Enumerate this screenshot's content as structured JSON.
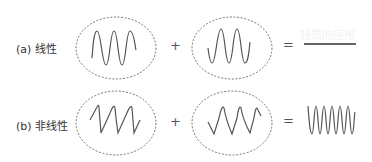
{
  "figure": {
    "rows": [
      {
        "id": "a",
        "label": "(a)  线性",
        "wave1": "sine",
        "operator_plus": "+",
        "wave2": "sine",
        "operator_equals": "=",
        "result": "flat line (cancellation)"
      },
      {
        "id": "b",
        "label": "(b)  非线性",
        "wave1": "sawtooth",
        "operator_plus": "+",
        "wave2": "sawtooth",
        "operator_equals": "=",
        "result": "higher-frequency sine"
      }
    ],
    "colors": {
      "wave": "#555555",
      "ellipse_border": "#666666",
      "result_line": "#333333"
    }
  },
  "background_text": {
    "heading_fragment": "特质的应用"
  }
}
